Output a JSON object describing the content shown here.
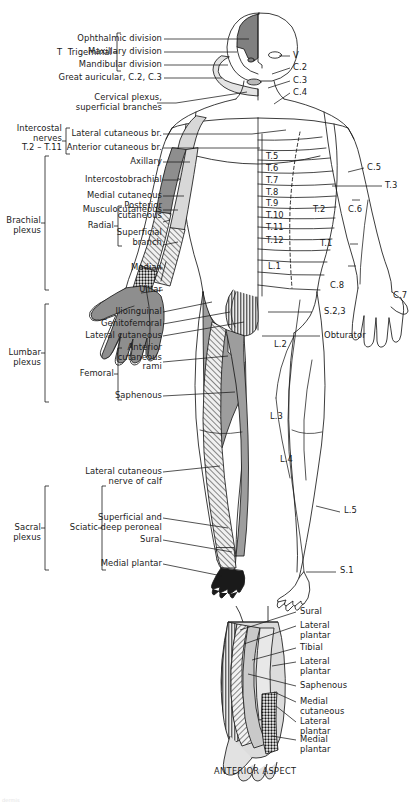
{
  "figure": {
    "caption": "ANTERIOR ASPECT",
    "watermark": "dermis",
    "colors": {
      "outline": "#1a1a1a",
      "dark_fill": "#808080",
      "mid_fill": "#a8a8a8",
      "light_fill": "#d6d6d6",
      "pale_fill": "#e8e8e8",
      "black_fill": "#1a1a1a",
      "text": "#1a1a1a"
    }
  },
  "left_labels": {
    "trigeminal_group": "T  Trigeminal",
    "trigeminal_items": [
      "Ophthalmic division",
      "Maxillary division",
      "Mandibular division"
    ],
    "great_auricular": "Great auricular, C.2, C.3",
    "cervical_plexus": "Cervical plexus,\nsuperficial branches",
    "intercostal_group": "Intercostal\nnerves\nT.2 – T.11",
    "intercostal_items": [
      "Lateral cutaneous br.",
      "Anterior cutaneous br."
    ],
    "brachial_group": "Brachial\nplexus",
    "brachial_items": [
      "Axillary",
      "Intercostobrachial",
      "Medial cutaneous",
      "Musculocutaneous"
    ],
    "radial_group": "Radial",
    "radial_items": [
      "Posterior\ncutaneous",
      "Superficial\nbranch"
    ],
    "median": "Median",
    "ulnar": "Ulnar",
    "lumbar_group": "Lumbar\nplexus",
    "lumbar_items": [
      "Ilioinguinal",
      "Genitofemoral",
      "Lateral cutaneous"
    ],
    "femoral_group": "Femoral",
    "femoral_items": [
      "Anterior\ncutaneous\nrami",
      "Saphenous"
    ],
    "sacral_group": "Sacral\nplexus",
    "sciatic_group": "Sciatic",
    "sciatic_items": [
      "Lateral cutaneous\nnerve of calf",
      "Superficial and\ndeep peroneal",
      "Sural",
      "Medial plantar"
    ]
  },
  "right_labels": {
    "head": [
      "V",
      "C.2",
      "C.3",
      "C.4"
    ],
    "upper_limb": [
      "C.5",
      "T.3",
      "C.6",
      "T.1",
      "C.8",
      "C.7"
    ],
    "trunk_left_of_arm": [
      "T.2"
    ],
    "nerve": "Obturator",
    "sacral": "S.2,3",
    "lower_limb": [
      "L.2",
      "L.3",
      "L.4",
      "L.5",
      "S.1"
    ],
    "foot_sural": "Sural"
  },
  "dermatomes_trunk": [
    "T.5",
    "T.6",
    "T.7",
    "T.8",
    "T.9",
    "T.10",
    "T.11",
    "T.12",
    "L.1"
  ],
  "foot_labels": [
    "Sural",
    "Lateral\nplantar",
    "Tibial",
    "Lateral\nplantar",
    "Saphenous",
    "Medial\ncutaneous",
    "Lateral\nplantar",
    "Medial\nplantar"
  ]
}
